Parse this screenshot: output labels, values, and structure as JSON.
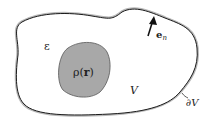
{
  "diagram": {
    "labels": {
      "epsilon": "ε",
      "rho": "ρ(",
      "r": "r",
      "rho_close": ")",
      "volume": "V",
      "boundary": "∂V",
      "normal_e": "e",
      "normal_sub": "n"
    },
    "colors": {
      "outline": "#1a1a1a",
      "outline_halo": "#b0b0b0",
      "charge_fill": "#a8a8a8",
      "charge_stroke": "#555555",
      "background": "#ffffff"
    }
  }
}
